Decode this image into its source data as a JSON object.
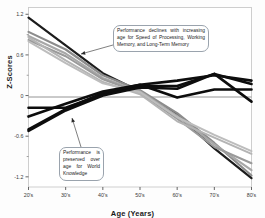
{
  "chart_data": {
    "type": "line",
    "title": "",
    "xlabel": "Age (Years)",
    "ylabel": "Z-Scores",
    "categories": [
      "20's",
      "30's",
      "40's",
      "50's",
      "60's",
      "70's",
      "80's"
    ],
    "x": [
      0,
      1,
      2,
      3,
      4,
      5,
      6
    ],
    "ylim": [
      -1.35,
      1.3
    ],
    "yticks": [
      1.2,
      0.6,
      0,
      -0.6,
      -1.2
    ],
    "ytick_labels": [
      "1.2",
      "0.6",
      "0",
      "-0.6",
      "-1.2"
    ],
    "xtick_labels": [
      "20's",
      "30's",
      "40's",
      "50's",
      "60's",
      "70's",
      "80's"
    ],
    "grid": false,
    "legend": "none",
    "zero_line": true,
    "series": [
      {
        "name": "Speed of Processing A",
        "group": "declining",
        "color": "#1c1c1c",
        "width": 2.2,
        "values": [
          1.15,
          0.74,
          0.33,
          0.06,
          -0.28,
          -0.78,
          -1.22
        ]
      },
      {
        "name": "Speed of Processing B",
        "group": "declining",
        "color": "#8c8c8c",
        "width": 2.2,
        "values": [
          0.94,
          0.68,
          0.3,
          0.08,
          -0.26,
          -0.7,
          -1.18
        ]
      },
      {
        "name": "Working Memory A",
        "group": "declining",
        "color": "#a8a8a8",
        "width": 2.2,
        "values": [
          0.88,
          0.62,
          0.26,
          0.06,
          -0.3,
          -0.72,
          -1.1
        ]
      },
      {
        "name": "Working Memory B",
        "group": "declining",
        "color": "#9a9a9a",
        "width": 2.0,
        "values": [
          0.82,
          0.58,
          0.24,
          0.04,
          -0.34,
          -0.76,
          -1.0
        ]
      },
      {
        "name": "Long-Term Memory A",
        "group": "declining",
        "color": "#b4b4b4",
        "width": 2.0,
        "values": [
          0.86,
          0.52,
          0.2,
          0.02,
          -0.38,
          -0.62,
          -0.86
        ]
      },
      {
        "name": "Long-Term Memory B",
        "group": "declining",
        "color": "#bdbdbd",
        "width": 2.0,
        "values": [
          0.8,
          0.48,
          0.18,
          0.05,
          -0.32,
          -0.58,
          -0.82
        ]
      },
      {
        "name": "World Knowledge A",
        "group": "preserved",
        "color": "#0d0d0d",
        "width": 2.6,
        "values": [
          -0.18,
          -0.18,
          0.02,
          0.14,
          0.14,
          0.32,
          0.17
        ]
      },
      {
        "name": "World Knowledge B",
        "group": "preserved",
        "color": "#0d0d0d",
        "width": 2.6,
        "values": [
          -0.31,
          -0.12,
          0.06,
          0.16,
          0.22,
          0.3,
          0.22
        ]
      },
      {
        "name": "World Knowledge C",
        "group": "preserved",
        "color": "#0d0d0d",
        "width": 2.6,
        "values": [
          -0.5,
          -0.2,
          0.04,
          0.16,
          -0.03,
          0.09,
          0.09
        ]
      },
      {
        "name": "World Knowledge D",
        "group": "preserved",
        "color": "#0d0d0d",
        "width": 2.6,
        "values": [
          -0.52,
          -0.22,
          0.0,
          0.12,
          0.1,
          0.32,
          -0.09
        ]
      }
    ],
    "annotations": [
      {
        "id": "declines",
        "text": "Performance declines with increasing age for Speed of Processing, Working Memory, and Long-Term Memory",
        "arrow_from": [
          113,
          45
        ],
        "arrow_to": [
          81,
          54
        ]
      },
      {
        "id": "preserved",
        "text": "Performance is preserved over age for World Knowledge",
        "arrow_from": [
          81,
          147
        ],
        "arrow_to": [
          72,
          118
        ]
      }
    ]
  },
  "axes": {
    "y_title": "Z-Scores",
    "x_title": "Age (Years)"
  }
}
